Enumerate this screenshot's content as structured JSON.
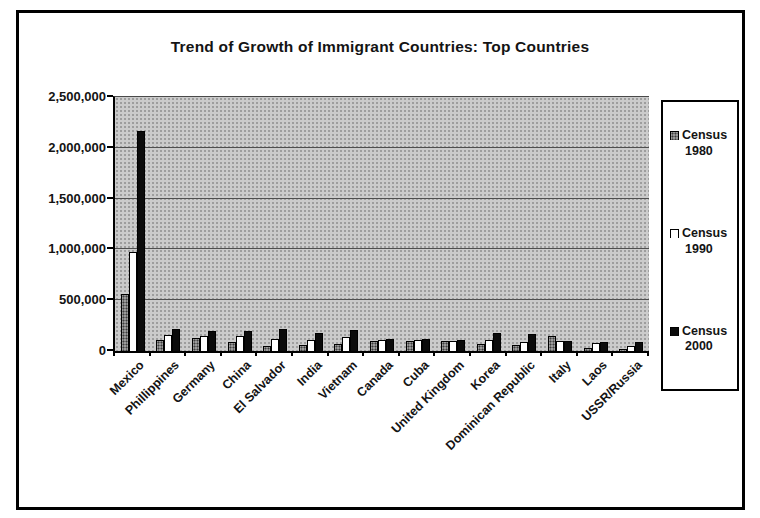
{
  "chart_data": {
    "type": "bar",
    "title": "Trend of Growth of Immigrant Countries: Top Countries",
    "categories": [
      "Mexico",
      "Phillippines",
      "Germany",
      "China",
      "El Salvador",
      "India",
      "Vietnam",
      "Canada",
      "Cuba",
      "United Kingdom",
      "Korea",
      "Dominican Republic",
      "Italy",
      "Laos",
      "USSR/Russia"
    ],
    "series": [
      {
        "name": "Census 1980",
        "color": "#9a9a9a",
        "values": [
          560000,
          110000,
          130000,
          90000,
          50000,
          60000,
          70000,
          100000,
          100000,
          95000,
          70000,
          60000,
          150000,
          25000,
          20000
        ]
      },
      {
        "name": "Census 1990",
        "color": "#ffffff",
        "values": [
          970000,
          160000,
          150000,
          150000,
          120000,
          110000,
          135000,
          105000,
          110000,
          100000,
          110000,
          90000,
          100000,
          80000,
          45000
        ]
      },
      {
        "name": "Census 2000",
        "color": "#0b0b0b",
        "values": [
          2170000,
          215000,
          195000,
          200000,
          215000,
          180000,
          205000,
          115000,
          115000,
          105000,
          175000,
          170000,
          95000,
          90000,
          90000
        ]
      }
    ],
    "xlabel": "",
    "ylabel": "",
    "ylim": [
      0,
      2500000
    ],
    "ytick_step": 500000,
    "ytick_labels": [
      "0",
      "500,000",
      "1,000,000",
      "1,500,000",
      "2,000,000",
      "2,500,000"
    ],
    "grid": true,
    "plot_background": "#cbcbcb",
    "legend_position": "right"
  }
}
